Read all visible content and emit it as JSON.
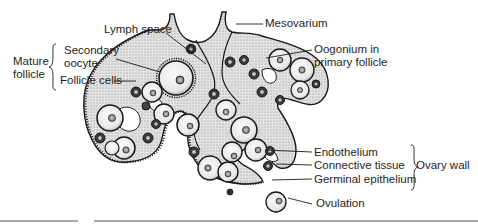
{
  "diagram": {
    "labels": {
      "lymph_space": "Lymph space",
      "mesovarium": "Mesovarium",
      "mature_follicle": [
        "Mature",
        "follicle"
      ],
      "secondary_oocyte": [
        "Secondary",
        "oocyte"
      ],
      "follicle_cells": "Follicle cells",
      "oogonium": [
        "Oogonium in",
        "primary follicle"
      ],
      "endothelium": "Endothelium",
      "connective_tissue": "Connective tissue",
      "germinal_epithelium": "Germinal epithelium",
      "ovary_wall": "Ovary wall",
      "ovulation": "Ovulation"
    },
    "groups": {
      "mature_follicle": [
        "Secondary oocyte",
        "Follicle cells"
      ],
      "ovary_wall": [
        "Endothelium",
        "Connective tissue",
        "Germinal epithelium"
      ]
    },
    "colors": {
      "ink": "#1a1a1a",
      "tissue_fill": "#e4e4e4",
      "cell_fill": "#f2f2f2",
      "background": "#ffffff"
    }
  }
}
